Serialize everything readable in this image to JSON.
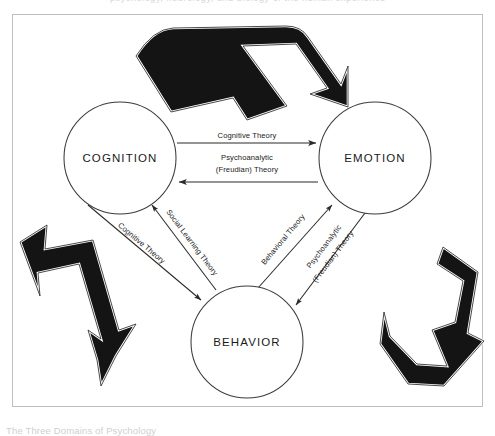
{
  "figure": {
    "caption": "The Three Domains of Psychology",
    "top_bleed_text": "psychology, neurology, and biology of the human experience"
  },
  "nodes": [
    {
      "id": "cognition",
      "label": "COGNITION",
      "cx": 120,
      "cy": 158,
      "r": 56
    },
    {
      "id": "emotion",
      "label": "EMOTION",
      "cx": 375,
      "cy": 158,
      "r": 56
    },
    {
      "id": "behavior",
      "label": "BEHAVIOR",
      "cx": 247,
      "cy": 342,
      "r": 56
    }
  ],
  "edges": [
    {
      "id": "cognition-to-emotion",
      "label": "Cognitive Theory",
      "from": "cognition",
      "to": "emotion",
      "direction": "right",
      "position": "top-horizontal"
    },
    {
      "id": "emotion-to-cognition",
      "label": "Psychoanalytic\n(Freudian) Theory",
      "label_line1": "Psychoanalytic",
      "label_line2": "(Freudian) Theory",
      "from": "emotion",
      "to": "cognition",
      "direction": "left",
      "position": "bottom-horizontal"
    },
    {
      "id": "cognition-to-behavior",
      "label": "Cognitive Theory",
      "from": "cognition",
      "to": "behavior",
      "direction": "down-right",
      "position": "left-diagonal-outer"
    },
    {
      "id": "behavior-to-cognition",
      "label": "Social Learning Theory",
      "from": "behavior",
      "to": "cognition",
      "direction": "up-left",
      "position": "left-diagonal-inner"
    },
    {
      "id": "behavior-to-emotion",
      "label": "Behavioral Theory",
      "from": "behavior",
      "to": "emotion",
      "direction": "up-right",
      "position": "right-diagonal-inner"
    },
    {
      "id": "emotion-to-behavior",
      "label": "Psychoanalytic\n(Freudian) Theory",
      "label_line1": "Psychoanalytic",
      "label_line2": "(Freudian) Theory",
      "from": "emotion",
      "to": "behavior",
      "direction": "down-left",
      "position": "right-diagonal-outer"
    }
  ],
  "decorations": [
    {
      "id": "recycle-arrow-top",
      "name": "black-folded-arrow-pointing-right"
    },
    {
      "id": "recycle-arrow-bottom-left",
      "name": "black-folded-arrow-pointing-up-left"
    },
    {
      "id": "recycle-arrow-bottom-right",
      "name": "black-folded-arrow-pointing-down-left"
    }
  ],
  "colors": {
    "ink": "#1a1a1a",
    "line": "#2b2b2b",
    "decoration_fill": "#141414",
    "frame": "#b9b9bd",
    "background": "#ffffff"
  }
}
